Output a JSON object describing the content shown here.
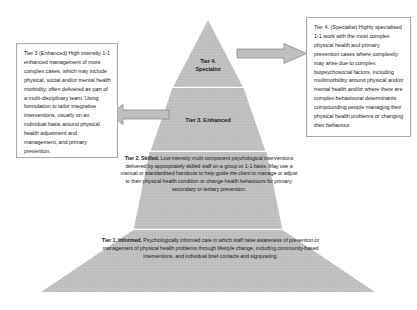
{
  "diagram": {
    "shape": "pyramid",
    "fill_color": "#bfbfbf",
    "divider_color": "#f2f2f2",
    "text_color": "#1a1a1a",
    "box_border_color": "#a6a6a6",
    "arrow_fill": "#bfbfbf",
    "arrow_stroke": "#808080"
  },
  "tiers": [
    {
      "id": "tier4",
      "label": "Tier 4.\nSpecialist",
      "label_line1": "Tier 4.",
      "label_line2": "Specialist"
    },
    {
      "id": "tier3",
      "label": "Tier 3. Enhanced"
    },
    {
      "id": "tier2",
      "heading": "Tier 2. Skilled.",
      "body": " Low intensity multi-component psychological interventions delivered by appropriately skilled staff on a group or 1-1 basis. May use a manual or standardised handouts to help guide the client to manage or adjust to their physical health condition or change health behaviours for primary, secondary or tertiary prevention."
    },
    {
      "id": "tier1",
      "heading": "Tier 1. Informed.",
      "body": " Psychologically informed care in which staff raise awareness of prevention or management of physical health problems through lifestyle change, including community-based interventions, and individual brief contacts and signposting."
    }
  ],
  "callouts": {
    "left": {
      "name": "tier-3-description",
      "text": "Tier 3 (Enhanced) High intensity 1-1 enhanced management of more complex cases, which may include physical, social and/or mental health morbidity, often delivered as part of a multi-disciplinary team. Using formulation to tailor integrative interventions, usually on an individual basis around physical health adjustment and management, and primary prevention."
    },
    "right": {
      "name": "tier-4-description",
      "text": "Tier 4. (Specialist) Highly specialised 1-1 work with the most complex physical health and primary prevention cases where complexity may arise due to complex biopsychosocial factors, including multimorbidity around physical and/or mental health and/or where there are complex behavioural determinants compounding people managing their physical health problems or changing their behaviour."
    }
  },
  "arrows": [
    {
      "id": "arrow-to-tier4-callout",
      "direction": "right"
    },
    {
      "id": "arrow-to-tier3-callout",
      "direction": "left"
    }
  ]
}
